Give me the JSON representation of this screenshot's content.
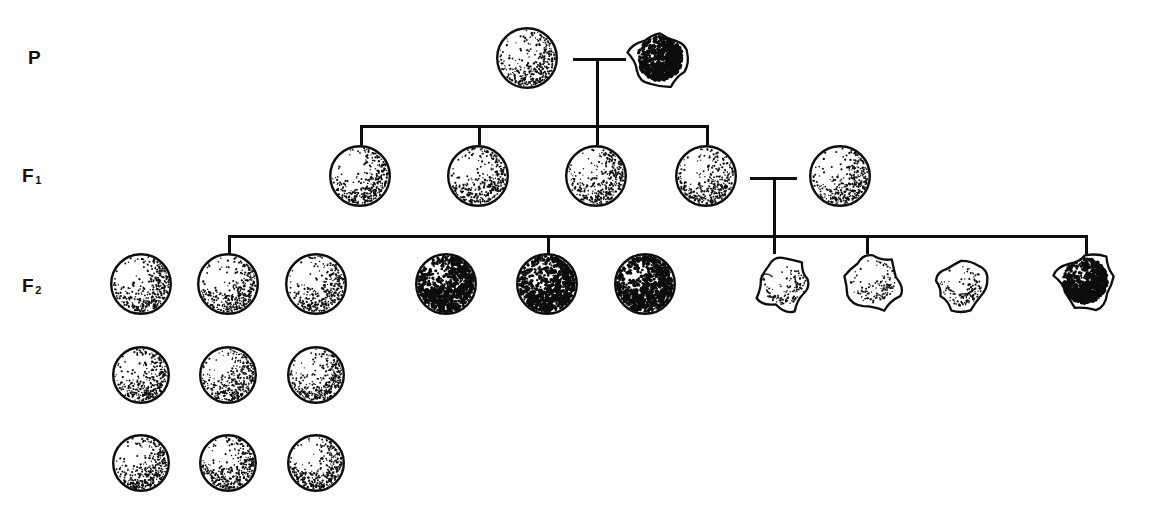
{
  "diagram": {
    "background_color": "#fdfdfc",
    "ink_color": "#0d0d0d"
  },
  "generations": [
    {
      "id": "P",
      "label": "P",
      "subscript": "",
      "label_x": 28,
      "label_y": 58,
      "organisms": [
        {
          "name": "p-parent-round-light",
          "phenotype": "round light seed",
          "shape": "round",
          "shade": "light",
          "x": 527,
          "y": 58,
          "size": 62
        },
        {
          "name": "p-parent-wrinkled-dark",
          "phenotype": "wrinkled dark seed",
          "shape": "wrinkled",
          "shade": "dark",
          "x": 660,
          "y": 58,
          "size": 62
        }
      ]
    },
    {
      "id": "F1",
      "label": "F",
      "subscript": "1",
      "label_x": 28,
      "label_y": 176,
      "organisms": [
        {
          "name": "f1-offspring-1",
          "phenotype": "round light seed",
          "shape": "round",
          "shade": "light",
          "x": 360,
          "y": 176,
          "size": 62
        },
        {
          "name": "f1-offspring-2",
          "phenotype": "round light seed",
          "shape": "round",
          "shade": "light",
          "x": 478,
          "y": 176,
          "size": 62
        },
        {
          "name": "f1-offspring-3",
          "phenotype": "round light seed",
          "shape": "round",
          "shade": "light",
          "x": 596,
          "y": 176,
          "size": 62
        },
        {
          "name": "f1-offspring-4",
          "phenotype": "round light seed",
          "shape": "round",
          "shade": "light",
          "x": 706,
          "y": 176,
          "size": 62
        },
        {
          "name": "f1-offspring-5",
          "phenotype": "round light seed",
          "shape": "round",
          "shade": "light",
          "x": 840,
          "y": 176,
          "size": 62
        }
      ]
    },
    {
      "id": "F2",
      "label": "F",
      "subscript": "2",
      "label_x": 28,
      "label_y": 286,
      "organisms": [
        {
          "name": "f2-seed-r1c1",
          "phenotype": "round light seed",
          "shape": "round",
          "shade": "light",
          "x": 141,
          "y": 284,
          "size": 62
        },
        {
          "name": "f2-seed-r1c2",
          "phenotype": "round light seed",
          "shape": "round",
          "shade": "light",
          "x": 228,
          "y": 284,
          "size": 62
        },
        {
          "name": "f2-seed-r1c3",
          "phenotype": "round light seed",
          "shape": "round",
          "shade": "light",
          "x": 316,
          "y": 284,
          "size": 62
        },
        {
          "name": "f2-seed-r1c4",
          "phenotype": "round dark seed",
          "shape": "round",
          "shade": "dark",
          "x": 446,
          "y": 284,
          "size": 62
        },
        {
          "name": "f2-seed-r1c5",
          "phenotype": "round dark seed",
          "shape": "round",
          "shade": "dark",
          "x": 547,
          "y": 284,
          "size": 62
        },
        {
          "name": "f2-seed-r1c6",
          "phenotype": "round dark seed",
          "shape": "round",
          "shade": "dark",
          "x": 645,
          "y": 284,
          "size": 62
        },
        {
          "name": "f2-seed-r1c7",
          "phenotype": "wrinkled light seed",
          "shape": "wrinkled",
          "shade": "light",
          "x": 784,
          "y": 283,
          "size": 60
        },
        {
          "name": "f2-seed-r1c8",
          "phenotype": "wrinkled light seed",
          "shape": "wrinkled",
          "shade": "light",
          "x": 873,
          "y": 281,
          "size": 62
        },
        {
          "name": "f2-seed-r1c9",
          "phenotype": "wrinkled light seed",
          "shape": "wrinkled",
          "shade": "light",
          "x": 961,
          "y": 285,
          "size": 58
        },
        {
          "name": "f2-seed-r1c10",
          "phenotype": "wrinkled dark seed",
          "shape": "wrinkled",
          "shade": "dark",
          "x": 1085,
          "y": 281,
          "size": 62
        },
        {
          "name": "f2-seed-r2c1",
          "phenotype": "round light seed",
          "shape": "round",
          "shade": "light",
          "x": 141,
          "y": 375,
          "size": 58
        },
        {
          "name": "f2-seed-r2c2",
          "phenotype": "round light seed",
          "shape": "round",
          "shade": "light",
          "x": 228,
          "y": 375,
          "size": 58
        },
        {
          "name": "f2-seed-r2c3",
          "phenotype": "round light seed",
          "shape": "round",
          "shade": "light",
          "x": 316,
          "y": 375,
          "size": 58
        },
        {
          "name": "f2-seed-r3c1",
          "phenotype": "round light seed",
          "shape": "round",
          "shade": "light",
          "x": 141,
          "y": 463,
          "size": 58
        },
        {
          "name": "f2-seed-r3c2",
          "phenotype": "round light seed",
          "shape": "round",
          "shade": "light",
          "x": 228,
          "y": 463,
          "size": 58
        },
        {
          "name": "f2-seed-r3c3",
          "phenotype": "round light seed",
          "shape": "round",
          "shade": "light",
          "x": 316,
          "y": 463,
          "size": 58
        }
      ]
    }
  ],
  "connectors": {
    "p_cross": {
      "name": "p-generation-cross-connector",
      "bar_x": 573,
      "bar_y": 58,
      "bar_width": 53,
      "stem_x": 596,
      "stem_top": 58,
      "stem_bottom": 126
    },
    "f1_sibship": {
      "name": "f1-sibship-bar",
      "bar_x": 360,
      "bar_y": 125,
      "bar_width": 346,
      "tick_xs": [
        360,
        478,
        596,
        706
      ],
      "tick_top": 125,
      "tick_bottom": 145
    },
    "f1_cross": {
      "name": "f1-generation-cross-connector",
      "bar_x": 750,
      "bar_y": 177,
      "bar_width": 47,
      "stem_x": 773,
      "stem_top": 177,
      "stem_bottom": 236
    },
    "f2_sibship": {
      "name": "f2-sibship-bar",
      "bar_x": 228,
      "bar_y": 235,
      "bar_width": 857,
      "tick_xs": [
        228,
        547,
        773,
        866,
        1085
      ],
      "tick_top": 235,
      "tick_bottom": 254
    }
  },
  "legend_semantics": {
    "ratio": "9 : 3 : 3 : 1",
    "classes": [
      "round light",
      "round dark",
      "wrinkled light",
      "wrinkled dark"
    ],
    "counts": [
      9,
      3,
      3,
      1
    ]
  }
}
